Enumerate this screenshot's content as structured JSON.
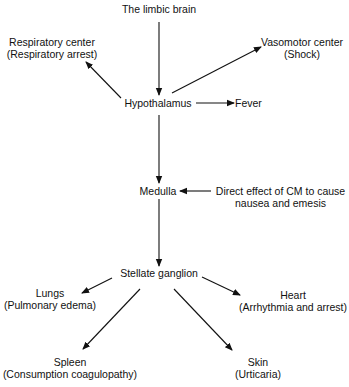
{
  "diagram": {
    "nodes": {
      "limbic": {
        "line1": "The limbic brain"
      },
      "respiratory": {
        "line1": "Respiratory center",
        "line2": "(Respiratory arrest)"
      },
      "vasomotor": {
        "line1": "Vasomotor center",
        "line2": "(Shock)"
      },
      "hypothalamus": {
        "line1": "Hypothalamus"
      },
      "fever": {
        "line1": "Fever"
      },
      "medulla": {
        "line1": "Medulla"
      },
      "cm": {
        "line1": "Direct effect of CM to cause",
        "line2": "nausea and emesis"
      },
      "stellate": {
        "line1": "Stellate ganglion"
      },
      "lungs": {
        "line1": "Lungs",
        "line2": "(Pulmonary edema)"
      },
      "heart": {
        "line1": "Heart",
        "line2": "(Arrhythmia and arrest)"
      },
      "spleen": {
        "line1": "Spleen",
        "line2": "(Consumption coagulopathy)"
      },
      "skin": {
        "line1": "Skin",
        "line2": "(Urticaria)"
      }
    },
    "edges": [
      {
        "from": "The limbic brain",
        "to": "Hypothalamus"
      },
      {
        "from": "Hypothalamus",
        "to": "Respiratory center"
      },
      {
        "from": "Hypothalamus",
        "to": "Vasomotor center"
      },
      {
        "from": "Hypothalamus",
        "to": "Fever"
      },
      {
        "from": "Hypothalamus",
        "to": "Medulla"
      },
      {
        "from": "Direct effect of CM",
        "to": "Medulla"
      },
      {
        "from": "Medulla",
        "to": "Stellate ganglion"
      },
      {
        "from": "Stellate ganglion",
        "to": "Lungs"
      },
      {
        "from": "Stellate ganglion",
        "to": "Heart"
      },
      {
        "from": "Stellate ganglion",
        "to": "Spleen"
      },
      {
        "from": "Stellate ganglion",
        "to": "Skin"
      }
    ]
  }
}
